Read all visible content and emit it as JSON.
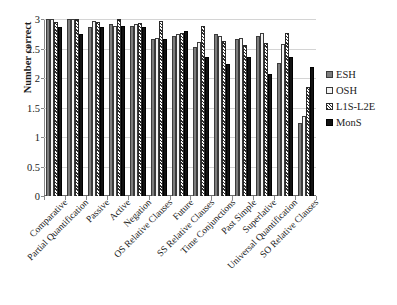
{
  "chart_data": {
    "type": "bar",
    "title": "",
    "xlabel": "",
    "ylabel": "Number correct",
    "ylim": [
      0,
      3
    ],
    "yticks": [
      "0",
      "0.5",
      "1",
      "1.5",
      "2",
      "2.5",
      "3"
    ],
    "ytick_values": [
      0,
      0.5,
      1,
      1.5,
      2,
      2.5,
      3
    ],
    "grid": true,
    "legend_position": "right",
    "categories": [
      "Comparative",
      "Partial Quantification",
      "Passive",
      "Active",
      "Negation",
      "OS Relative Clauses",
      "Future",
      "SS Relative Clauses",
      "Time Conjunctions",
      "Past Simple",
      "Superlative",
      "Universal Quantification",
      "SO Relative Clauses"
    ],
    "series": [
      {
        "name": "ESH",
        "color": "#7d7d7d",
        "values": [
          3.0,
          3.0,
          2.87,
          2.91,
          2.89,
          2.66,
          2.71,
          2.53,
          2.75,
          2.66,
          2.72,
          2.25,
          1.24
        ]
      },
      {
        "name": "OSH",
        "color": "#f4f4f4",
        "values": [
          3.0,
          3.0,
          2.96,
          2.89,
          2.92,
          2.68,
          2.75,
          2.61,
          2.71,
          2.67,
          2.77,
          2.58,
          1.35
        ]
      },
      {
        "name": "L1S-L2E",
        "color": "hatch",
        "values": [
          2.95,
          3.0,
          2.95,
          3.0,
          2.94,
          2.96,
          2.77,
          2.88,
          2.62,
          2.56,
          2.59,
          2.77,
          1.84
        ]
      },
      {
        "name": "MonS",
        "color": "#121212",
        "values": [
          2.86,
          2.74,
          2.87,
          2.88,
          2.86,
          2.66,
          2.8,
          2.36,
          2.24,
          2.36,
          2.07,
          2.35,
          2.19
        ]
      }
    ]
  },
  "legend": {
    "items": [
      {
        "label": "ESH",
        "swatch": "esh"
      },
      {
        "label": "OSH",
        "swatch": "osh"
      },
      {
        "label": "L1S-L2E",
        "swatch": "l1s"
      },
      {
        "label": "MonS",
        "swatch": "mons"
      }
    ]
  }
}
